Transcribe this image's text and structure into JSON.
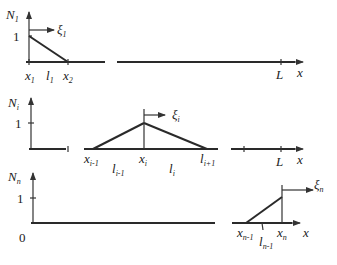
{
  "diagram": {
    "panels": [
      {
        "name": "N1",
        "ylabel": "N",
        "ylabel_sub": "1",
        "one_label": "1",
        "local_coord": "ξ",
        "local_coord_sub": "1",
        "labels": [
          {
            "t": "x",
            "s": "1"
          },
          {
            "t": "l",
            "s": "1"
          },
          {
            "t": "x",
            "s": "2"
          },
          {
            "t": "L",
            "s": ""
          },
          {
            "t": "x",
            "s": ""
          }
        ]
      },
      {
        "name": "Ni",
        "ylabel": "N",
        "ylabel_sub": "i",
        "one_label": "1",
        "local_coord": "ξ",
        "local_coord_sub": "i",
        "labels": [
          {
            "t": "x",
            "s": "i-1"
          },
          {
            "t": "l",
            "s": "i-1"
          },
          {
            "t": "x",
            "s": "i"
          },
          {
            "t": "l",
            "s": "i"
          },
          {
            "t": "l",
            "s": "i+1"
          },
          {
            "t": "L",
            "s": ""
          },
          {
            "t": "x",
            "s": ""
          }
        ]
      },
      {
        "name": "Nn",
        "ylabel": "N",
        "ylabel_sub": "n",
        "one_label": "1",
        "zero_label": "0",
        "local_coord": "ξ",
        "local_coord_sub": "n",
        "labels": [
          {
            "t": "x",
            "s": "n-1"
          },
          {
            "t": "l",
            "s": "n-1"
          },
          {
            "t": "x",
            "s": "n"
          },
          {
            "t": "x",
            "s": ""
          }
        ]
      }
    ]
  }
}
